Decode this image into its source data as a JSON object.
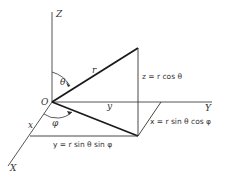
{
  "figure": {
    "type": "spherical-coordinates-diagram",
    "axes": {
      "z_label": "Z",
      "y_label": "Y",
      "x_label": "X",
      "origin_label": "O"
    },
    "angles": {
      "theta": "θ",
      "phi": "φ"
    },
    "segments": {
      "r_label": "r",
      "y_label": "y",
      "x_label": "x"
    },
    "equations": {
      "z": "z = r cos θ",
      "x": "x = r sin θ cos φ",
      "y": "y = r sin θ sin φ"
    },
    "colors": {
      "line": "#1a1a1a",
      "axis": "#555555",
      "text": "#333333",
      "background": "#ffffff"
    }
  }
}
